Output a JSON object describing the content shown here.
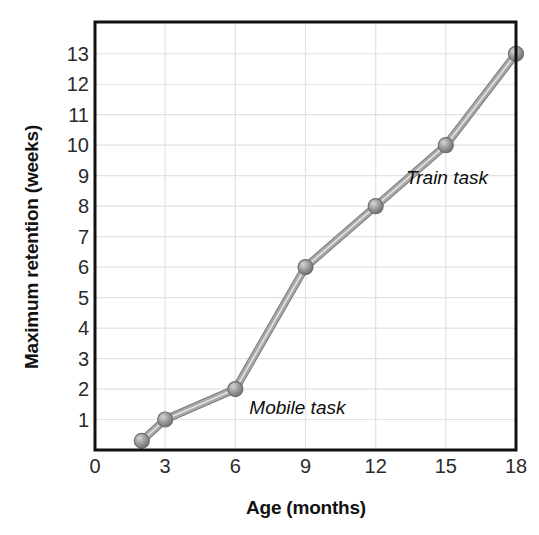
{
  "chart_data": {
    "type": "line",
    "title": "",
    "xlabel": "Age (months)",
    "ylabel": "Maximum retention (weeks)",
    "xlim": [
      0,
      18
    ],
    "ylim": [
      0,
      13.6
    ],
    "xticks": [
      "0",
      "3",
      "6",
      "9",
      "12",
      "15",
      "18"
    ],
    "xtick_values": [
      0,
      3,
      6,
      9,
      12,
      15,
      18
    ],
    "yticks": [
      "1",
      "2",
      "3",
      "4",
      "5",
      "6",
      "7",
      "8",
      "9",
      "10",
      "11",
      "12",
      "13"
    ],
    "ytick_values": [
      1,
      2,
      3,
      4,
      5,
      6,
      7,
      8,
      9,
      10,
      11,
      12,
      13
    ],
    "grid": true,
    "legend_position": "inline-annotations",
    "series": [
      {
        "name": "Maximum retention",
        "x": [
          2,
          3,
          6,
          9,
          12,
          15,
          18
        ],
        "values": [
          0.3,
          1,
          2,
          6,
          8,
          10,
          13
        ],
        "color": "#9a9a9a",
        "marker": "circle"
      }
    ],
    "annotations": [
      {
        "text": "Mobile task",
        "x": 6.6,
        "y": 1.35
      },
      {
        "text": "Train task",
        "x": 13.3,
        "y": 8.9
      }
    ],
    "colors": {
      "line": "#9a9a9a",
      "line_highlight": "#d8d8d8",
      "marker_fill": "#a0a0a0",
      "marker_edge": "#6e6e6e",
      "grid": "#e2e2e6",
      "frame": "#111111",
      "text": "#121212"
    }
  }
}
